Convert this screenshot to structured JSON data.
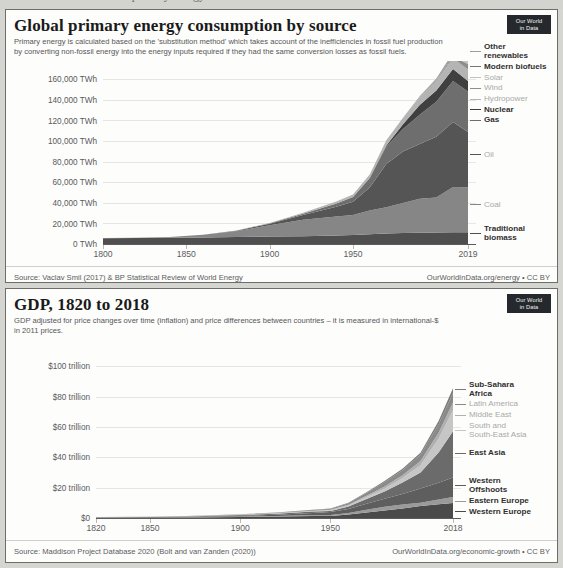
{
  "page": {
    "background_color": "#d5d5d1",
    "cutoff_top_text": "Global primary energy"
  },
  "owid_logo": {
    "line1": "Our World",
    "line2": "in Data",
    "color": "#25292e"
  },
  "charts": [
    {
      "id": "energy",
      "title": "Global primary energy consumption by source",
      "subtitle": "Primary energy is calculated based on the 'substitution method' which takes account of the inefficiencies in fossil fuel production by converting non-fossil energy into the energy inputs required if they had the same conversion losses as fossil fuels.",
      "source_left": "Source: Vaclav Smil (2017) & BP Statistical Review of World Energy",
      "source_right": "OurWorldInData.org/energy • CC BY"
    },
    {
      "id": "gdp",
      "title": "GDP, 1820 to 2018",
      "subtitle": "GDP adjusted for price changes over time (inflation) and price differences between countries – it is measured in international-$ in 2011 prices.",
      "source_left": "Source: Maddison Project Database 2020 (Bolt and van Zanden (2020))",
      "source_right": "OurWorldInData.org/economic-growth • CC BY"
    }
  ],
  "chart_data": [
    {
      "type": "area",
      "id": "energy",
      "title": "Global primary energy consumption by source",
      "subtitle": "Primary energy is calculated based on the 'substitution method' which takes account of the inefficiencies in fossil fuel production by converting non-fossil energy into the energy inputs required if they had the same conversion losses as fossil fuels.",
      "stacked": true,
      "xlabel": "",
      "ylabel": "TWh",
      "xlim": [
        1800,
        2019
      ],
      "ylim": [
        0,
        170000
      ],
      "grid": true,
      "legend_position": "right",
      "x_ticks": [
        1800,
        1850,
        1900,
        1950,
        2019
      ],
      "x_tick_labels": [
        "1800",
        "1850",
        "1900",
        "1950",
        "2019"
      ],
      "y_ticks": [
        0,
        20000,
        40000,
        60000,
        80000,
        100000,
        120000,
        140000,
        160000
      ],
      "y_tick_labels": [
        "0 TWh",
        "20,000 TWh",
        "40,000 TWh",
        "60,000 TWh",
        "80,000 TWh",
        "100,000 TWh",
        "120,000 TWh",
        "140,000 TWh",
        "160,000 TWh"
      ],
      "x": [
        1800,
        1820,
        1840,
        1860,
        1880,
        1900,
        1920,
        1940,
        1950,
        1960,
        1970,
        1980,
        1990,
        2000,
        2010,
        2019
      ],
      "series": [
        {
          "name": "Traditional biomass",
          "color": "#4f4f4f",
          "label_lines": [
            "Traditional",
            "biomass"
          ],
          "label_bold": true,
          "values": [
            5600,
            5700,
            6000,
            6400,
            6800,
            7200,
            7600,
            8200,
            8600,
            9400,
            10200,
            10800,
            11000,
            11200,
            11400,
            11400
          ]
        },
        {
          "name": "Coal",
          "color": "#868686",
          "label_lines": [
            "Coal"
          ],
          "label_bold": false,
          "values": [
            100,
            300,
            900,
            2500,
            5600,
            11000,
            16000,
            18500,
            19500,
            23000,
            25500,
            29000,
            33000,
            34000,
            44000,
            43800
          ]
        },
        {
          "name": "Oil",
          "color": "#555555",
          "label_lines": [
            "Oil"
          ],
          "label_bold": false,
          "values": [
            0,
            0,
            0,
            50,
            400,
            1500,
            4500,
            9500,
            13000,
            22500,
            42000,
            50000,
            53000,
            59000,
            63000,
            53600
          ]
        },
        {
          "name": "Gas",
          "color": "#6e6e6e",
          "label_lines": [
            "Gas"
          ],
          "label_bold": true,
          "values": [
            0,
            0,
            0,
            0,
            100,
            400,
            1200,
            3000,
            4500,
            9000,
            17000,
            22000,
            28500,
            34000,
            40000,
            39300
          ]
        },
        {
          "name": "Nuclear",
          "color": "#3f3f3f",
          "label_lines": [
            "Nuclear"
          ],
          "label_bold": true,
          "values": [
            0,
            0,
            0,
            0,
            0,
            0,
            0,
            0,
            0,
            200,
            1000,
            4500,
            9500,
            11000,
            11500,
            10100
          ]
        },
        {
          "name": "Hydropower",
          "color": "#b4b4b4",
          "label_lines": [
            "Hydropower"
          ],
          "label_bold": false,
          "values": [
            0,
            0,
            0,
            0,
            100,
            400,
            1000,
            2000,
            2400,
            3500,
            5000,
            6000,
            7500,
            9000,
            10500,
            11300
          ]
        },
        {
          "name": "Wind",
          "color": "#8e8e8e",
          "label_lines": [
            "Wind"
          ],
          "label_bold": false,
          "values": [
            0,
            0,
            0,
            0,
            0,
            0,
            0,
            0,
            0,
            0,
            0,
            0,
            100,
            500,
            1800,
            5500
          ]
        },
        {
          "name": "Solar",
          "color": "#c2c2c2",
          "label_lines": [
            "Solar"
          ],
          "label_bold": false,
          "values": [
            0,
            0,
            0,
            0,
            0,
            0,
            0,
            0,
            0,
            0,
            0,
            0,
            0,
            50,
            400,
            3000
          ]
        },
        {
          "name": "Modern biofuels",
          "color": "#757575",
          "label_lines": [
            "Modern biofuels"
          ],
          "label_bold": true,
          "values": [
            0,
            0,
            0,
            0,
            0,
            0,
            0,
            0,
            0,
            0,
            0,
            100,
            300,
            700,
            1500,
            2500
          ]
        },
        {
          "name": "Other renewables",
          "color": "#9d9d9d",
          "label_lines": [
            "Other",
            "renewables"
          ],
          "label_bold": true,
          "values": [
            0,
            0,
            0,
            0,
            0,
            0,
            0,
            0,
            0,
            0,
            100,
            300,
            700,
            1200,
            2000,
            3300
          ]
        }
      ],
      "source_left": "Source: Vaclav Smil (2017) & BP Statistical Review of World Energy",
      "source_right": "OurWorldInData.org/energy • CC BY"
    },
    {
      "type": "area",
      "id": "gdp",
      "title": "GDP, 1820 to 2018",
      "subtitle": "GDP adjusted for price changes over time (inflation) and price differences between countries – it is measured in international-$ in 2011 prices.",
      "stacked": true,
      "xlabel": "",
      "ylabel": "trillion international-$",
      "xlim": [
        1820,
        2018
      ],
      "ylim": [
        0,
        112
      ],
      "grid": true,
      "legend_position": "right",
      "x_ticks": [
        1820,
        1850,
        1900,
        1950,
        2018
      ],
      "x_tick_labels": [
        "1820",
        "1850",
        "1900",
        "1950",
        "2018"
      ],
      "y_ticks": [
        0,
        20,
        40,
        60,
        80,
        100
      ],
      "y_tick_labels": [
        "$0",
        "$20 trillion",
        "$40 trillion",
        "$60 trillion",
        "$80 trillion",
        "$100 trillion"
      ],
      "x": [
        1820,
        1850,
        1870,
        1900,
        1920,
        1940,
        1950,
        1960,
        1970,
        1980,
        1990,
        2000,
        2010,
        2018
      ],
      "series": [
        {
          "name": "Western Europe",
          "color": "#4a4a4a",
          "label_lines": [
            "Western Europe"
          ],
          "label_bold": true,
          "values": [
            0.16,
            0.26,
            0.38,
            0.72,
            0.95,
            1.35,
            1.4,
            2.3,
            3.7,
            5.0,
            6.3,
            7.9,
            9.0,
            9.8
          ]
        },
        {
          "name": "Eastern Europe",
          "color": "#9a9a9a",
          "label_lines": [
            "Eastern Europe"
          ],
          "label_bold": true,
          "values": [
            0.05,
            0.08,
            0.12,
            0.25,
            0.3,
            0.55,
            0.6,
            1.0,
            1.7,
            2.4,
            2.5,
            2.2,
            3.2,
            4.0
          ]
        },
        {
          "name": "Western Offshoots",
          "color": "#5e5e5e",
          "label_lines": [
            "Western",
            "Offshoots"
          ],
          "label_bold": true,
          "values": [
            0.02,
            0.07,
            0.15,
            0.5,
            0.95,
            1.4,
            1.9,
            2.7,
            4.0,
            5.3,
            7.0,
            9.4,
            11.0,
            12.8
          ]
        },
        {
          "name": "East Asia",
          "color": "#6b6b6b",
          "label_lines": [
            "East Asia"
          ],
          "label_bold": true,
          "values": [
            0.25,
            0.27,
            0.3,
            0.42,
            0.6,
            0.9,
            0.8,
            1.5,
            3.2,
            4.8,
            7.5,
            10.5,
            20.0,
            30.5
          ]
        },
        {
          "name": "South and South-East Asia",
          "color": "#c6c6c6",
          "label_lines": [
            "South and",
            "South-East Asia"
          ],
          "label_bold": false,
          "values": [
            0.16,
            0.18,
            0.2,
            0.3,
            0.35,
            0.45,
            0.5,
            0.8,
            1.2,
            1.8,
            3.0,
            4.8,
            9.0,
            14.0
          ]
        },
        {
          "name": "Middle East",
          "color": "#b0b0b0",
          "label_lines": [
            "Middle East"
          ],
          "label_bold": false,
          "values": [
            0.03,
            0.04,
            0.05,
            0.07,
            0.1,
            0.15,
            0.2,
            0.4,
            0.9,
            1.5,
            1.9,
            2.7,
            4.0,
            5.0
          ]
        },
        {
          "name": "Latin America",
          "color": "#8a8a8a",
          "label_lines": [
            "Latin America"
          ],
          "label_bold": false,
          "values": [
            0.02,
            0.04,
            0.07,
            0.16,
            0.28,
            0.45,
            0.6,
            1.0,
            1.7,
            2.8,
            3.2,
            4.2,
            5.5,
            6.3
          ]
        },
        {
          "name": "Sub-Sahara Africa",
          "color": "#7b7b7b",
          "label_lines": [
            "Sub-Sahara",
            "Africa"
          ],
          "label_bold": true,
          "values": [
            0.02,
            0.03,
            0.04,
            0.07,
            0.1,
            0.16,
            0.2,
            0.32,
            0.55,
            0.8,
            1.0,
            1.3,
            2.2,
            3.1
          ]
        }
      ],
      "source_left": "Source: Maddison Project Database 2020 (Bolt and van Zanden (2020))",
      "source_right": "OurWorldInData.org/economic-growth • CC BY"
    }
  ]
}
